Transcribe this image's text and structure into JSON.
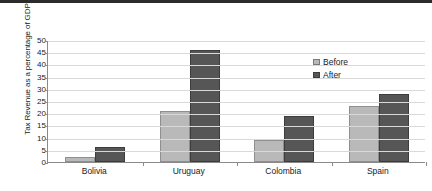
{
  "chart_data": {
    "type": "bar",
    "title": "",
    "subtitle": "",
    "xlabel": "",
    "ylabel": "Tax Revenue as a percentage of GDP",
    "categories": [
      "Bolivia",
      "Uruguay",
      "Colombia",
      "Spain"
    ],
    "series": [
      {
        "name": "Before",
        "color": "#b9b9b9",
        "values": [
          2,
          21,
          9,
          23
        ]
      },
      {
        "name": "After",
        "color": "#565656",
        "values": [
          6,
          46,
          19,
          28
        ]
      }
    ],
    "ylim": [
      0,
      50
    ],
    "yticks": [
      0,
      5,
      10,
      15,
      20,
      25,
      30,
      35,
      40,
      45,
      50
    ],
    "ytick_labels": [
      "0",
      "5",
      "10",
      "15",
      "20",
      "25",
      "30",
      "35",
      "40",
      "45",
      "50"
    ],
    "grid": true,
    "legend_position": "upper right",
    "legend_entries": [
      "Before",
      "After"
    ]
  }
}
